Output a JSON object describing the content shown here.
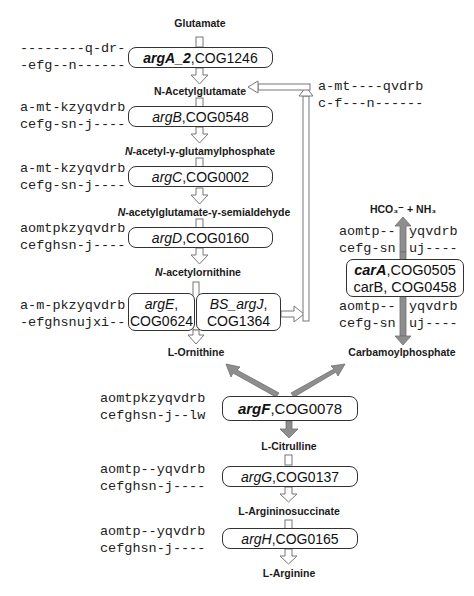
{
  "metabolites": {
    "glutamate": "Glutamate",
    "n_acetylglutamate": "N-Acetylglutamate",
    "n_acetyl_glutamylphosphate_prefix": "N",
    "n_acetyl_glutamylphosphate_rest": "-acetyl-γ-glutamylphosphate",
    "n_acetylglutamate_semialdehyde_prefix": "N",
    "n_acetylglutamate_semialdehyde_rest": "-acetylglutamate-γ-semialdehyde",
    "n_acetylornithine_prefix": "N",
    "n_acetylornithine_rest": "-acetylornithine",
    "l_ornithine": "L-Ornithine",
    "hco3_nh3": "HCO₃⁻ + NH₃",
    "carbamoylphosphate": "Carbamoylphosphate",
    "l_citrulline": "L-Citrulline",
    "l_argininosuccinate": "L-Argininosuccinate",
    "l_arginine": "L-Arginine"
  },
  "enzymes": {
    "argA": {
      "gene": "argA_2",
      "sep": ",",
      "cog": "COG1246",
      "profile": [
        "--------q-dr-",
        "-efg--n------"
      ]
    },
    "argB": {
      "gene": "argB",
      "sep": " , ",
      "cog": "COG0548",
      "profile": [
        "a-mt-kzyqvdrb",
        "cefg-sn-j----"
      ]
    },
    "argC": {
      "gene": "argC",
      "sep": " , ",
      "cog": "COG0002",
      "profile": [
        "a-mt-kzyqvdrb",
        "cefg-sn-j----"
      ]
    },
    "argD": {
      "gene": "argD",
      "sep": " , ",
      "cog": "COG0160",
      "profile": [
        "aomtpkzyqvdrb",
        "cefghsn-j----"
      ]
    },
    "argE": {
      "gene": "argE",
      "sep": ",",
      "cog": "COG0624",
      "profile": [
        "a-m-pkzyqvdrb",
        "-efghsnujxi--"
      ]
    },
    "argJ": {
      "gene": "BS_argJ",
      "sep": ",",
      "cog": "COG1364",
      "profile": [
        "a-mt----qvdrb",
        "c-f---n------"
      ]
    },
    "carA": {
      "gene": "carA",
      "sep": ",",
      "cog": "COG0505",
      "profile_top": [
        "aomtp--",
        "yqvdrb",
        "cefg-sn",
        "uj----"
      ]
    },
    "carB": {
      "gene": "carB",
      "sep": ", ",
      "cog": "COG0458",
      "profile_bottom": [
        "aomtp--",
        "yqvdrb",
        "cefg-sn",
        "uj----"
      ]
    },
    "argF": {
      "gene": "argF",
      "sep": ",",
      "cog": "COG0078",
      "profile": [
        "aomtpkzyqvdrb",
        "cefghsn-j--lw"
      ]
    },
    "argG": {
      "gene": "argG",
      "sep": " , ",
      "cog": "COG0137",
      "profile": [
        "aomtp--yqvdrb",
        "cefghsn-j----"
      ]
    },
    "argH": {
      "gene": "argH",
      "sep": " , ",
      "cog": "COG0165",
      "profile": [
        "aomtp--yqvdrb",
        "cefghsn-j----"
      ]
    }
  },
  "colors": {
    "box_border": "#333333",
    "hollow_arrow": "#888888",
    "gray_arrow": "#8c8c8c"
  }
}
